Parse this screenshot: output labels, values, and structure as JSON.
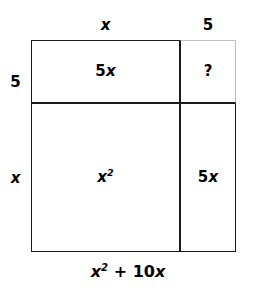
{
  "figure": {
    "type": "area-model-diagram",
    "title_caption": "x² + 10x",
    "background_color": "#ffffff",
    "line_color": "#1c1c1c",
    "faint_line_color": "#bfbfbf"
  },
  "dimensions": {
    "top_left_label": "x",
    "top_right_label": "5",
    "left_top_label": "5",
    "left_bottom_label": "x"
  },
  "cells": {
    "top_left": {
      "coefficient": "5",
      "variable": "x"
    },
    "top_right": {
      "text": "?"
    },
    "bottom_left": {
      "variable": "x",
      "exponent": "2"
    },
    "bottom_right": {
      "coefficient": "5",
      "variable": "x"
    }
  },
  "caption": {
    "variable": "x",
    "exponent": "2",
    "operator": "+",
    "term": "10",
    "term_variable": "x"
  },
  "chart_data": {
    "type": "table",
    "categories": [
      "x",
      "5"
    ],
    "rows": [
      "5",
      "x"
    ],
    "values": [
      [
        "5x",
        "?"
      ],
      [
        "x²",
        "5x"
      ]
    ],
    "xlabel": "",
    "ylabel": ""
  }
}
